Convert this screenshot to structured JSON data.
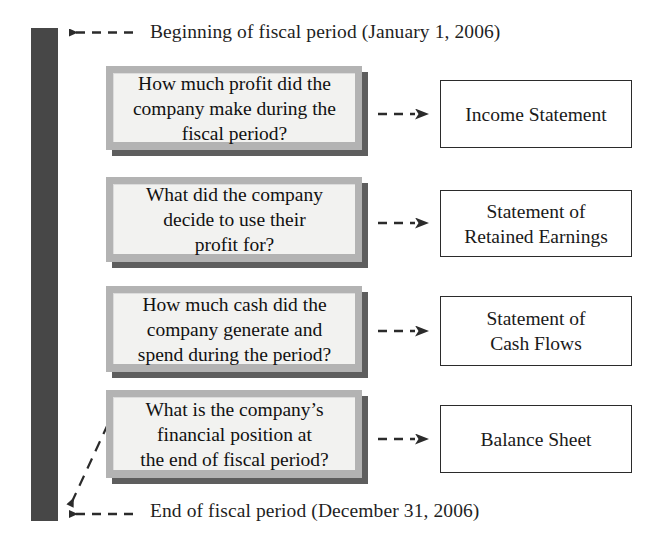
{
  "diagram": {
    "colors": {
      "timeline_bar": "#474747",
      "question_box_border": "#b3b3b3",
      "question_box_fill": "#f2f2f0",
      "question_box_shadow": "#5e5e5e",
      "statement_box_border": "#2b2b2b",
      "statement_box_fill": "#ffffff",
      "arrow": "#2b2b2b",
      "text": "#1a1a1a"
    }
  },
  "timeline": {
    "bar_name": "fiscal-period-bar",
    "begin_label": "Beginning of fiscal period (January 1, 2006)",
    "end_label": "End of fiscal period (December 31, 2006)"
  },
  "rows": [
    {
      "question": "How much profit did the\ncompany make during the\nfiscal period?",
      "statement": "Income Statement",
      "arrow_icon": "dashed-right-arrow-icon"
    },
    {
      "question": "What did the company\ndecide to use their\nprofit for?",
      "statement": "Statement of\nRetained Earnings",
      "arrow_icon": "dashed-right-arrow-icon"
    },
    {
      "question": "How much cash did the\ncompany generate and\nspend during the period?",
      "statement": "Statement of\nCash Flows",
      "arrow_icon": "dashed-right-arrow-icon"
    },
    {
      "question": "What is the company’s\nfinancial position at\nthe end of fiscal period?",
      "statement": "Balance Sheet",
      "arrow_icon": "dashed-right-arrow-icon"
    }
  ],
  "icons": {
    "begin_arrow": "dashed-left-arrow-icon",
    "end_arrow": "dashed-left-arrow-icon",
    "diagonal_arrow": "dashed-diagonal-arrow-icon"
  }
}
